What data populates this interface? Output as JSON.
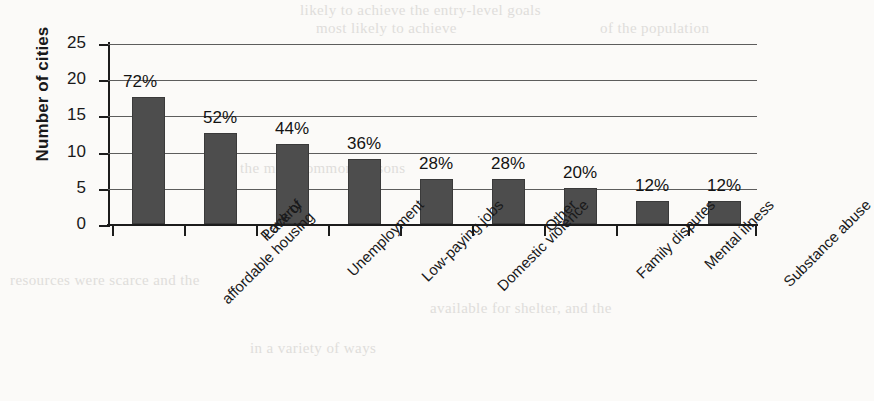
{
  "chart_data": {
    "type": "bar",
    "title": "",
    "xlabel": "",
    "ylabel": "Number of cities",
    "ylim": [
      0,
      25
    ],
    "yticks": [
      0,
      5,
      10,
      15,
      20,
      25
    ],
    "grid": true,
    "legend": "none",
    "categories": [
      "Lack of affordable housing",
      "Poverty",
      "Unemployment",
      "Low-paying jobs",
      "Domestic violence",
      "Other",
      "Family disputes",
      "Mental illness",
      "Substance abuse"
    ],
    "values": [
      17.6,
      12.6,
      11.1,
      9.0,
      6.2,
      6.2,
      5.0,
      3.2,
      3.2
    ],
    "data_labels": [
      "72%",
      "52%",
      "44%",
      "36%",
      "28%",
      "28%",
      "20%",
      "12%",
      "12%"
    ],
    "percent_values": [
      72,
      52,
      44,
      36,
      28,
      28,
      20,
      12,
      12
    ],
    "bar_color": "#4d4d4d",
    "background_color": "#fbfaf8",
    "axis_color": "#1c1c1c",
    "category_lines": [
      [
        "Lack of",
        "affordable housing"
      ],
      [
        "Poverty",
        ""
      ],
      [
        "Unemployment",
        ""
      ],
      [
        "Low-paying jobs",
        ""
      ],
      [
        "Domestic violence",
        ""
      ],
      [
        "Other",
        ""
      ],
      [
        "Family disputes",
        ""
      ],
      [
        "Mental illness",
        ""
      ],
      [
        "Substance abuse",
        ""
      ]
    ]
  },
  "page_bleed": {
    "top_right": "likely to achieve the entry-level goals",
    "line_a": "most likely to achieve",
    "line_b": "of the population",
    "mid_left": "the most common reasons",
    "lower_a": "resources were scarce and the",
    "lower_b": "available for shelter, and the",
    "lower_c": "in a variety of ways"
  }
}
